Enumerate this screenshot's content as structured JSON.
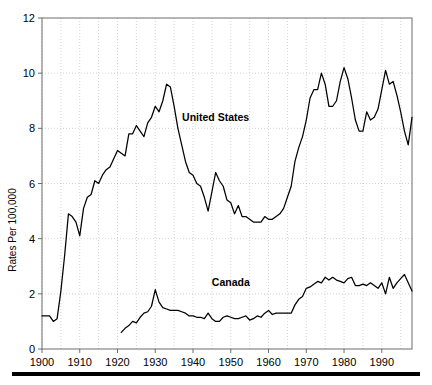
{
  "chart_data": {
    "type": "line",
    "title": "",
    "subtitle": "",
    "xlabel": "",
    "ylabel": "Rates Per 100,000",
    "xlim": [
      1900,
      1998
    ],
    "ylim": [
      0,
      12
    ],
    "yticks": [
      0,
      2,
      4,
      6,
      8,
      10,
      12
    ],
    "xticks": [
      1900,
      1910,
      1920,
      1930,
      1940,
      1950,
      1960,
      1970,
      1980,
      1990
    ],
    "xtick_labels": [
      "1900",
      "1910",
      "1920",
      "1930",
      "1940",
      "1950",
      "1960",
      "1970",
      "1980",
      "1990"
    ],
    "ytick_labels": [
      "0",
      "2",
      "4",
      "6",
      "8",
      "10",
      "12"
    ],
    "grid": true,
    "grid_style": "dotted",
    "legend_position": "inline-annotation",
    "annotations": [
      {
        "text": "United States",
        "x": 1946,
        "y": 8.25
      },
      {
        "text": "Canada",
        "x": 1950,
        "y": 2.3
      }
    ],
    "series": [
      {
        "name": "United States",
        "color": "#000000",
        "x": [
          1900,
          1901,
          1902,
          1903,
          1904,
          1905,
          1906,
          1907,
          1908,
          1909,
          1910,
          1911,
          1912,
          1913,
          1914,
          1915,
          1916,
          1917,
          1918,
          1919,
          1920,
          1921,
          1922,
          1923,
          1924,
          1925,
          1926,
          1927,
          1928,
          1929,
          1930,
          1931,
          1932,
          1933,
          1934,
          1935,
          1936,
          1937,
          1938,
          1939,
          1940,
          1941,
          1942,
          1943,
          1944,
          1945,
          1946,
          1947,
          1948,
          1949,
          1950,
          1951,
          1952,
          1953,
          1954,
          1955,
          1956,
          1957,
          1958,
          1959,
          1960,
          1961,
          1962,
          1963,
          1964,
          1965,
          1966,
          1967,
          1968,
          1969,
          1970,
          1971,
          1972,
          1973,
          1974,
          1975,
          1976,
          1977,
          1978,
          1979,
          1980,
          1981,
          1982,
          1983,
          1984,
          1985,
          1986,
          1987,
          1988,
          1989,
          1990,
          1991,
          1992,
          1993,
          1994,
          1995,
          1996,
          1997,
          1998
        ],
        "y": [
          1.2,
          1.2,
          1.2,
          1.0,
          1.1,
          2.1,
          3.4,
          4.9,
          4.8,
          4.6,
          4.1,
          5.1,
          5.5,
          5.6,
          6.1,
          6.0,
          6.3,
          6.5,
          6.6,
          6.9,
          7.2,
          7.1,
          7.0,
          7.8,
          7.8,
          8.1,
          7.9,
          7.7,
          8.2,
          8.4,
          8.8,
          8.6,
          9.0,
          9.6,
          9.5,
          8.8,
          8.0,
          7.4,
          6.8,
          6.4,
          6.3,
          6.0,
          5.9,
          5.5,
          5.0,
          5.7,
          6.4,
          6.1,
          5.9,
          5.4,
          5.3,
          4.9,
          5.2,
          4.8,
          4.8,
          4.7,
          4.6,
          4.6,
          4.6,
          4.8,
          4.7,
          4.7,
          4.8,
          4.9,
          5.1,
          5.5,
          5.9,
          6.8,
          7.3,
          7.7,
          8.3,
          9.1,
          9.4,
          9.4,
          10.0,
          9.6,
          8.8,
          8.8,
          9.0,
          9.7,
          10.2,
          9.8,
          9.1,
          8.3,
          7.9,
          7.9,
          8.6,
          8.3,
          8.4,
          8.7,
          9.4,
          10.1,
          9.6,
          9.7,
          9.2,
          8.6,
          7.9,
          7.4,
          8.4
        ]
      },
      {
        "name": "Canada",
        "color": "#000000",
        "x": [
          1921,
          1922,
          1923,
          1924,
          1925,
          1926,
          1927,
          1928,
          1929,
          1930,
          1931,
          1932,
          1933,
          1934,
          1935,
          1936,
          1937,
          1938,
          1939,
          1940,
          1941,
          1942,
          1943,
          1944,
          1945,
          1946,
          1947,
          1948,
          1949,
          1950,
          1951,
          1952,
          1953,
          1954,
          1955,
          1956,
          1957,
          1958,
          1959,
          1960,
          1961,
          1962,
          1963,
          1964,
          1965,
          1966,
          1967,
          1968,
          1969,
          1970,
          1971,
          1972,
          1973,
          1974,
          1975,
          1976,
          1977,
          1978,
          1979,
          1980,
          1981,
          1982,
          1983,
          1984,
          1985,
          1986,
          1987,
          1988,
          1989,
          1990,
          1991,
          1992,
          1993,
          1994,
          1995,
          1996,
          1997,
          1998
        ],
        "y": [
          0.6,
          0.75,
          0.85,
          1.0,
          0.95,
          1.15,
          1.3,
          1.35,
          1.55,
          2.15,
          1.7,
          1.5,
          1.45,
          1.4,
          1.4,
          1.4,
          1.35,
          1.3,
          1.2,
          1.2,
          1.15,
          1.15,
          1.1,
          1.3,
          1.1,
          1.0,
          1.0,
          1.15,
          1.2,
          1.15,
          1.1,
          1.1,
          1.15,
          1.2,
          1.05,
          1.1,
          1.2,
          1.15,
          1.3,
          1.4,
          1.25,
          1.3,
          1.3,
          1.3,
          1.3,
          1.3,
          1.6,
          1.8,
          1.9,
          2.2,
          2.25,
          2.35,
          2.45,
          2.4,
          2.6,
          2.5,
          2.6,
          2.5,
          2.45,
          2.4,
          2.55,
          2.6,
          2.3,
          2.3,
          2.35,
          2.3,
          2.4,
          2.3,
          2.2,
          2.4,
          2.0,
          2.6,
          2.2,
          2.4,
          2.55,
          2.7,
          2.4,
          2.1
        ]
      }
    ]
  },
  "figure": {
    "background_color": "#ffffff",
    "axis_color": "#6d6d6d",
    "grid_color": "#b9b9b9",
    "line_color": "#000000",
    "footer_rule": "solid-black-bar"
  }
}
